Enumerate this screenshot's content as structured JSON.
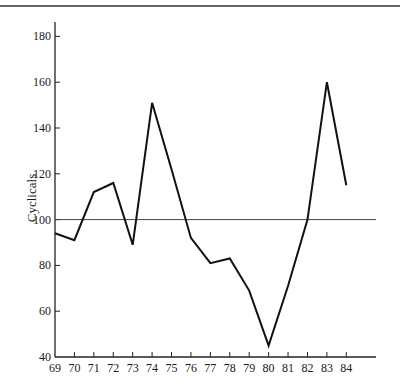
{
  "chart_data": {
    "type": "line",
    "title": "",
    "xlabel": "",
    "ylabel": "Cyclicals",
    "x": [
      "69",
      "70",
      "71",
      "72",
      "73",
      "74",
      "75",
      "76",
      "77",
      "78",
      "79",
      "80",
      "81",
      "82",
      "83",
      "84"
    ],
    "series": [
      {
        "name": "Cyclicals",
        "values": [
          94,
          91,
          112,
          116,
          89,
          151,
          122,
          92,
          81,
          83,
          69,
          45,
          71,
          100,
          160,
          115
        ]
      }
    ],
    "reference_line": {
      "y": 100
    },
    "ylim": [
      40,
      185
    ],
    "yticks": [
      40,
      60,
      80,
      100,
      120,
      140,
      160,
      180
    ],
    "grid": false,
    "legend": null
  },
  "colors": {
    "line": "#111111",
    "axis": "#222222",
    "reference": "#444444",
    "header_rule": "#333333"
  }
}
